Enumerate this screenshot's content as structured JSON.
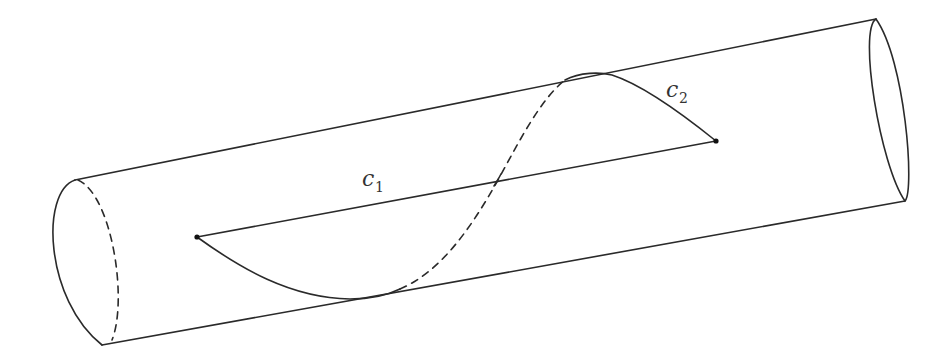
{
  "figure": {
    "labels": {
      "c1": {
        "base": "c",
        "subscript": "1"
      },
      "c2": {
        "base": "c",
        "subscript": "2"
      }
    },
    "colors": {
      "stroke": "#2a2a2a",
      "background": "#ffffff"
    },
    "hidden_line_style": "dashed"
  }
}
